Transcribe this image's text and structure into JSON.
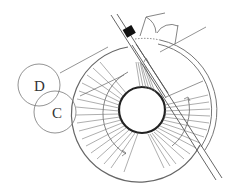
{
  "diagram": {
    "type": "spiral-staircase-plan",
    "labels": [
      {
        "id": "D",
        "text": "D"
      },
      {
        "id": "C",
        "text": "C"
      }
    ],
    "colors": {
      "line": "#555555",
      "thin_line": "#777777",
      "fill_dark": "#111111",
      "background": "#ffffff"
    }
  }
}
